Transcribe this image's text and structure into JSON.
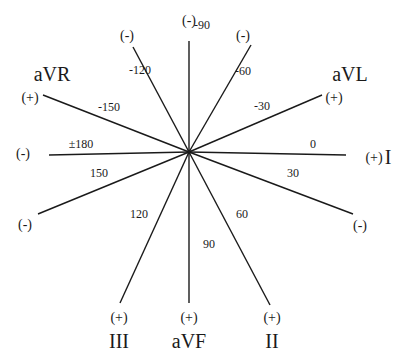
{
  "diagram": {
    "center": [
      189,
      152
    ],
    "axes": [
      {
        "name": "axis-minus-90",
        "x2": 189,
        "y2": 41,
        "degree": "-90",
        "deg_pos": [
          202,
          29
        ],
        "end_label": "(-)",
        "end_pos": [
          189,
          25
        ]
      },
      {
        "name": "axis-minus-120",
        "x2": 133,
        "y2": 47,
        "degree": "-120",
        "deg_pos": [
          140,
          74
        ],
        "end_label": "(-)",
        "end_pos": [
          127,
          40
        ]
      },
      {
        "name": "axis-minus-60",
        "x2": 251,
        "y2": 45,
        "degree": "-60",
        "deg_pos": [
          243,
          75
        ],
        "end_label": "(-)",
        "end_pos": [
          243,
          40
        ]
      },
      {
        "name": "axis-minus-150",
        "x2": 43,
        "y2": 95,
        "degree": "-150",
        "deg_pos": [
          109,
          111
        ],
        "end_label": "(+)",
        "end_pos": [
          30,
          102
        ]
      },
      {
        "name": "axis-minus-30",
        "x2": 322,
        "y2": 95,
        "degree": "-30",
        "deg_pos": [
          262,
          110
        ],
        "end_label": "(+)",
        "end_pos": [
          334,
          102
        ]
      },
      {
        "name": "axis-180",
        "x2": 49,
        "y2": 155,
        "degree": "±180",
        "deg_pos": [
          81,
          148
        ],
        "end_label": "(-)",
        "end_pos": [
          23,
          158
        ]
      },
      {
        "name": "axis-0",
        "x2": 346,
        "y2": 155,
        "degree": "0",
        "deg_pos": [
          313,
          148
        ],
        "end_label": "(+)",
        "end_pos": [
          374,
          162
        ]
      },
      {
        "name": "axis-150",
        "x2": 38,
        "y2": 214,
        "degree": "150",
        "deg_pos": [
          99,
          177
        ],
        "end_label": "(-)",
        "end_pos": [
          25,
          229
        ]
      },
      {
        "name": "axis-30",
        "x2": 353,
        "y2": 214,
        "degree": "30",
        "deg_pos": [
          293,
          177
        ],
        "end_label": "(-)",
        "end_pos": [
          360,
          230
        ]
      },
      {
        "name": "axis-120",
        "x2": 120,
        "y2": 303,
        "degree": "120",
        "deg_pos": [
          139,
          218
        ],
        "end_label": "(+)",
        "end_pos": [
          119,
          322
        ]
      },
      {
        "name": "axis-90",
        "x2": 189,
        "y2": 303,
        "degree": "90",
        "deg_pos": [
          209,
          248
        ],
        "end_label": "(+)",
        "end_pos": [
          189,
          322
        ]
      },
      {
        "name": "axis-60",
        "x2": 270,
        "y2": 305,
        "degree": "60",
        "deg_pos": [
          242,
          218
        ],
        "end_label": "(+)",
        "end_pos": [
          272,
          322
        ]
      }
    ],
    "leads": [
      {
        "name": "lead-avr",
        "label": "aVR",
        "pos": [
          52,
          81
        ]
      },
      {
        "name": "lead-avl",
        "label": "aVL",
        "pos": [
          350,
          81
        ]
      },
      {
        "name": "lead-i",
        "label": "I",
        "pos": [
          388,
          164
        ]
      },
      {
        "name": "lead-iii",
        "label": "III",
        "pos": [
          119,
          348
        ]
      },
      {
        "name": "lead-avf",
        "label": "aVF",
        "pos": [
          189,
          348
        ]
      },
      {
        "name": "lead-ii",
        "label": "II",
        "pos": [
          272,
          348
        ]
      }
    ]
  }
}
